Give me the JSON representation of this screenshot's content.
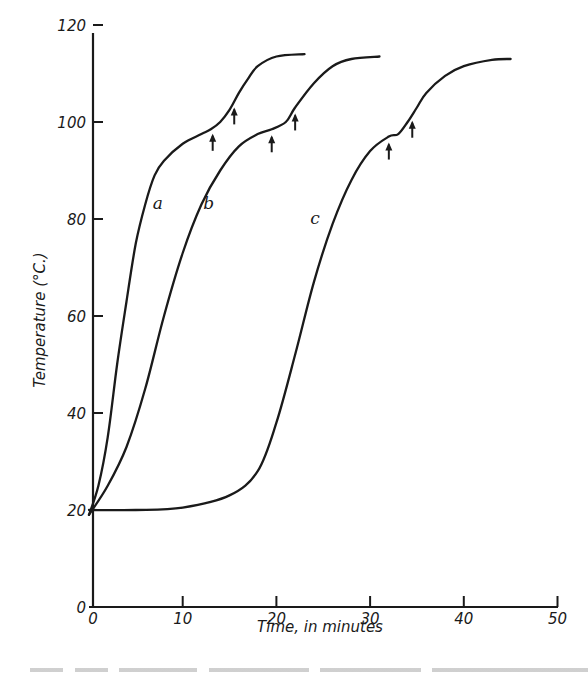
{
  "chart_data": {
    "type": "line",
    "title": "",
    "xlabel": "Time, in minutes",
    "ylabel": "Temperature (°C.)",
    "xlim": [
      0,
      50
    ],
    "ylim": [
      0,
      120
    ],
    "grid": false,
    "legend": "none (curves labeled inline a, b, c)",
    "x_ticks": [
      0,
      10,
      20,
      30,
      40,
      50
    ],
    "y_ticks": [
      0,
      20,
      40,
      60,
      80,
      100,
      120
    ],
    "series": [
      {
        "name": "a",
        "label_pos": [
          6.8,
          82
        ],
        "x": [
          0,
          1,
          2,
          3,
          4,
          5,
          6,
          7,
          8,
          10,
          12,
          13,
          14,
          15,
          16,
          17,
          18,
          20,
          23
        ],
        "y": [
          19,
          25,
          35,
          50,
          63,
          75,
          83,
          89,
          92,
          95.5,
          97.5,
          98.5,
          100,
          102.5,
          106,
          109,
          111.5,
          113.5,
          114
        ],
        "arrows": [
          13.2,
          15.5
        ]
      },
      {
        "name": "b",
        "label_pos": [
          12.2,
          82
        ],
        "x": [
          0,
          2,
          4,
          6,
          8,
          10,
          12,
          14,
          16,
          18,
          19.5,
          21,
          22,
          24,
          26,
          28,
          31
        ],
        "y": [
          19,
          25,
          33,
          45,
          60,
          73,
          83,
          90,
          95,
          97.5,
          98.5,
          100,
          103,
          108,
          111.5,
          113,
          113.5
        ],
        "arrows": [
          19.5,
          22.0
        ]
      },
      {
        "name": "c",
        "label_pos": [
          23.6,
          79
        ],
        "x": [
          0,
          5,
          10,
          15,
          18,
          20,
          22,
          24,
          26,
          28,
          30,
          32,
          33,
          34,
          35,
          36,
          38,
          40,
          43,
          45
        ],
        "y": [
          20,
          20,
          20.5,
          23,
          28,
          38,
          52,
          67,
          79,
          88,
          94,
          97,
          97.5,
          100,
          103,
          106,
          109.5,
          111.5,
          112.8,
          113
        ],
        "arrows": [
          32.0,
          34.5
        ]
      }
    ]
  },
  "axes": {
    "x_tick_labels": [
      "0",
      "10",
      "20",
      "30",
      "40",
      "50"
    ],
    "y_tick_labels": [
      "0",
      "20",
      "40",
      "60",
      "80",
      "100",
      "120"
    ],
    "x_title": "Time, in minutes",
    "y_title": "Temperature (°C.)"
  },
  "style": {
    "ink": "#1a1a1a",
    "background": "#ffffff"
  }
}
